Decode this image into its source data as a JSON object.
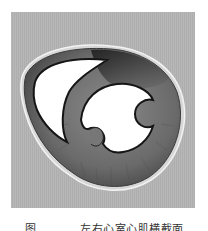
{
  "figure": {
    "colors": {
      "background_panel": "#b4b4b4",
      "myocardium": "#6e6e6e",
      "myocardium_dark": "#2e2e2e",
      "cavity": "#ffffff",
      "epicardium": "#d8d8d8"
    },
    "labels": {
      "left_cavity": "right-ventricle-cavity",
      "right_cavity": "left-ventricle-cavity"
    }
  },
  "caption": {
    "figure_number": "图",
    "text": "左右心室心肌横截面"
  }
}
